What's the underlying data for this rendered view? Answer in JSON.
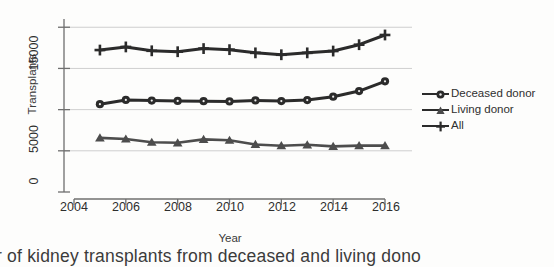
{
  "chart_data": {
    "type": "line",
    "title": "",
    "xlabel": "Year",
    "ylabel": "Transplants",
    "x": [
      2005,
      2006,
      2007,
      2008,
      2009,
      2010,
      2011,
      2012,
      2013,
      2014,
      2015,
      2016
    ],
    "xlim": [
      2004,
      2016.6
    ],
    "ylim": [
      0,
      21000
    ],
    "xticks": [
      2004,
      2006,
      2008,
      2010,
      2012,
      2014,
      2016
    ],
    "xtick_labels": [
      "2004",
      "2006",
      "2008",
      "2010",
      "2012",
      "2014",
      "2016"
    ],
    "yticks": [
      0,
      5000,
      10000,
      15000,
      20000
    ],
    "ytick_labels": [
      "0",
      "5000",
      "",
      "15000",
      ""
    ],
    "ytick_labels_visible": [
      "0",
      "5000",
      "15000"
    ],
    "grid": true,
    "grid_axis": "y",
    "legend_position": "right",
    "line_color": "#2b2b2b",
    "grid_color": "#c9c9c9",
    "axis_color": "#6f6f6f",
    "series": [
      {
        "name": "Deceased donor",
        "marker": "circle",
        "values": [
          10660,
          11180,
          11100,
          11060,
          11020,
          11000,
          11120,
          11040,
          11160,
          11570,
          12250,
          13430
        ]
      },
      {
        "name": "Living donor",
        "marker": "triangle",
        "values": [
          6570,
          6430,
          6040,
          5970,
          6390,
          6280,
          5770,
          5620,
          5730,
          5540,
          5630,
          5630
        ]
      },
      {
        "name": "All",
        "marker": "plus",
        "values": [
          17230,
          17610,
          17140,
          17030,
          17410,
          17280,
          16890,
          16660,
          16890,
          17110,
          17880,
          19060
        ]
      }
    ]
  },
  "legend": {
    "items": [
      {
        "label": "Deceased donor",
        "marker": "circle"
      },
      {
        "label": "Living donor",
        "marker": "triangle"
      },
      {
        "label": "All",
        "marker": "plus"
      }
    ]
  },
  "caption": {
    "clipped_text": "r of kidney transplants from deceased and living dono",
    "ghost_text": ""
  }
}
